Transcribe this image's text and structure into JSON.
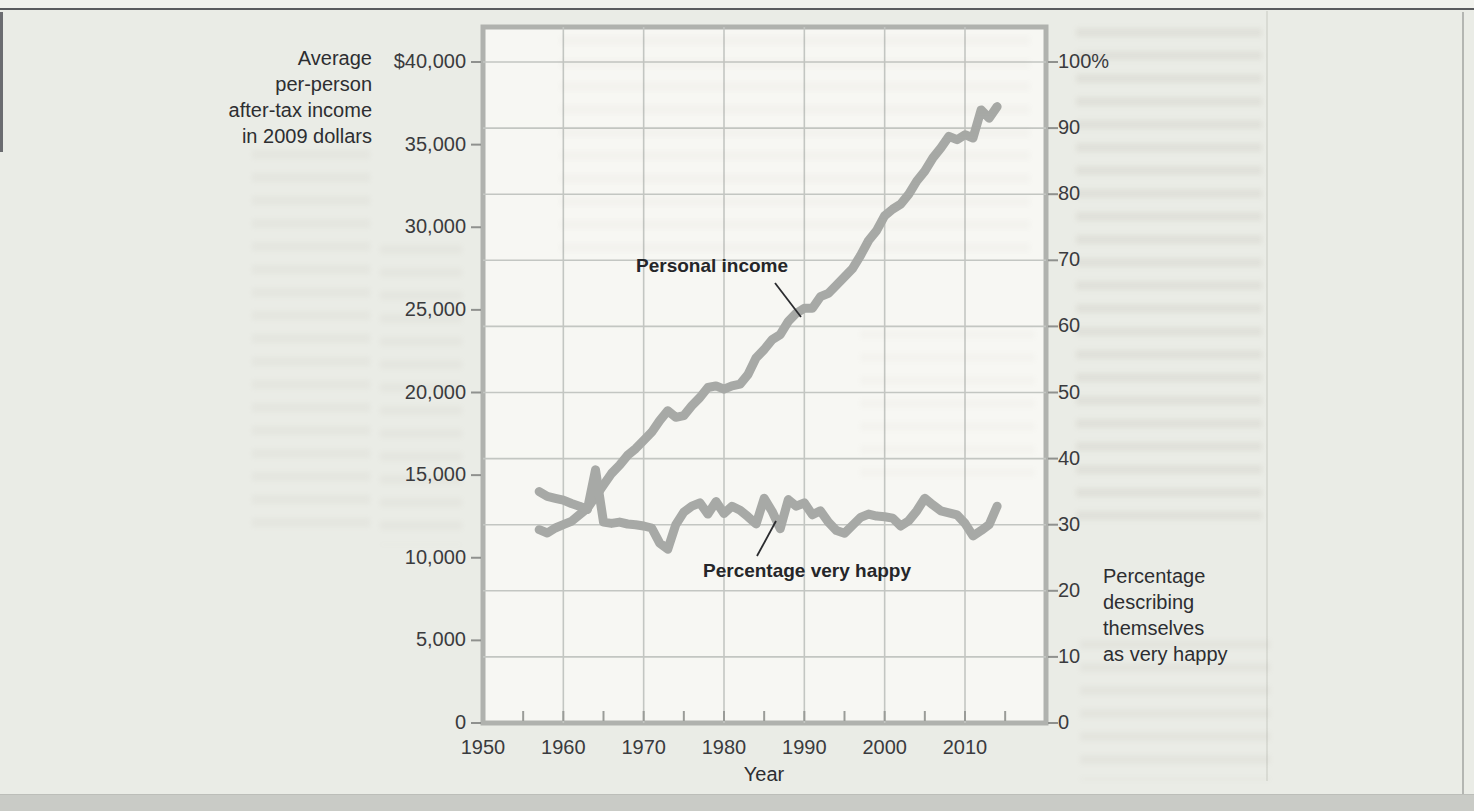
{
  "page": {
    "kind": "scanned textbook figure",
    "background_color": "#eaece6"
  },
  "chart_data": {
    "type": "line",
    "title": "",
    "x_axis": {
      "label": "Year",
      "tick_labels": [
        "1950",
        "1960",
        "1970",
        "1980",
        "1990",
        "2000",
        "2010"
      ],
      "tick_values": [
        1950,
        1960,
        1970,
        1980,
        1990,
        2000,
        2010
      ],
      "range": [
        1950,
        2020
      ],
      "minor_tick_step_years": 5,
      "gridline_step_years": 10
    },
    "y_left": {
      "title": "Average\nper-person\nafter-tax income\nin 2009 dollars",
      "tick_labels": [
        "$40,000",
        "35,000",
        "30,000",
        "25,000",
        "20,000",
        "15,000",
        "10,000",
        "5,000",
        "0"
      ],
      "tick_values": [
        40000,
        35000,
        30000,
        25000,
        20000,
        15000,
        10000,
        5000,
        0
      ],
      "range": [
        0,
        42200
      ]
    },
    "y_right": {
      "title": "Percentage\ndescribing\nthemselves\nas very happy",
      "tick_labels": [
        "100%",
        "90",
        "80",
        "70",
        "60",
        "50",
        "40",
        "30",
        "20",
        "10",
        "0"
      ],
      "tick_values": [
        100,
        90,
        80,
        70,
        60,
        50,
        40,
        30,
        20,
        10,
        0
      ],
      "range": [
        0,
        105.5
      ],
      "gridline_step_percent": 10
    },
    "grid": true,
    "legend": "in-plot annotations with pointer lines",
    "series": [
      {
        "name": "Personal income",
        "axis": "left",
        "points": [
          [
            1957,
            11700
          ],
          [
            1958,
            11500
          ],
          [
            1959,
            11800
          ],
          [
            1960,
            12000
          ],
          [
            1961,
            12200
          ],
          [
            1962,
            12600
          ],
          [
            1963,
            13000
          ],
          [
            1964,
            13700
          ],
          [
            1965,
            14400
          ],
          [
            1966,
            15100
          ],
          [
            1967,
            15600
          ],
          [
            1968,
            16200
          ],
          [
            1969,
            16600
          ],
          [
            1970,
            17100
          ],
          [
            1971,
            17600
          ],
          [
            1972,
            18300
          ],
          [
            1973,
            18900
          ],
          [
            1974,
            18500
          ],
          [
            1975,
            18600
          ],
          [
            1976,
            19200
          ],
          [
            1977,
            19700
          ],
          [
            1978,
            20300
          ],
          [
            1979,
            20400
          ],
          [
            1980,
            20200
          ],
          [
            1981,
            20400
          ],
          [
            1982,
            20500
          ],
          [
            1983,
            21100
          ],
          [
            1984,
            22100
          ],
          [
            1985,
            22600
          ],
          [
            1986,
            23200
          ],
          [
            1987,
            23500
          ],
          [
            1988,
            24300
          ],
          [
            1989,
            24800
          ],
          [
            1990,
            25100
          ],
          [
            1991,
            25100
          ],
          [
            1992,
            25800
          ],
          [
            1993,
            26000
          ],
          [
            1994,
            26500
          ],
          [
            1995,
            27000
          ],
          [
            1996,
            27500
          ],
          [
            1997,
            28300
          ],
          [
            1998,
            29200
          ],
          [
            1999,
            29800
          ],
          [
            2000,
            30700
          ],
          [
            2001,
            31100
          ],
          [
            2002,
            31400
          ],
          [
            2003,
            32000
          ],
          [
            2004,
            32800
          ],
          [
            2005,
            33400
          ],
          [
            2006,
            34200
          ],
          [
            2007,
            34800
          ],
          [
            2008,
            35500
          ],
          [
            2009,
            35300
          ],
          [
            2010,
            35600
          ],
          [
            2011,
            35400
          ],
          [
            2012,
            37100
          ],
          [
            2013,
            36600
          ],
          [
            2014,
            37300
          ]
        ]
      },
      {
        "name": "Percentage very happy",
        "axis": "right",
        "points": [
          [
            1957,
            35.0
          ],
          [
            1958,
            34.3
          ],
          [
            1959,
            34.0
          ],
          [
            1960,
            33.7
          ],
          [
            1961,
            33.2
          ],
          [
            1962,
            32.8
          ],
          [
            1963,
            32.3
          ],
          [
            1964,
            38.3
          ],
          [
            1965,
            30.4
          ],
          [
            1966,
            30.2
          ],
          [
            1967,
            30.4
          ],
          [
            1968,
            30.1
          ],
          [
            1969,
            30.0
          ],
          [
            1970,
            29.8
          ],
          [
            1971,
            29.5
          ],
          [
            1972,
            27.2
          ],
          [
            1973,
            26.3
          ],
          [
            1974,
            30.0
          ],
          [
            1975,
            31.9
          ],
          [
            1976,
            32.8
          ],
          [
            1977,
            33.3
          ],
          [
            1978,
            31.6
          ],
          [
            1979,
            33.5
          ],
          [
            1980,
            31.7
          ],
          [
            1981,
            32.8
          ],
          [
            1982,
            32.2
          ],
          [
            1983,
            31.2
          ],
          [
            1984,
            30.1
          ],
          [
            1985,
            34.0
          ],
          [
            1986,
            32.0
          ],
          [
            1987,
            29.4
          ],
          [
            1988,
            33.8
          ],
          [
            1989,
            32.8
          ],
          [
            1990,
            33.3
          ],
          [
            1991,
            31.5
          ],
          [
            1992,
            32.1
          ],
          [
            1993,
            30.4
          ],
          [
            1994,
            29.1
          ],
          [
            1995,
            28.7
          ],
          [
            1996,
            29.9
          ],
          [
            1997,
            31.1
          ],
          [
            1998,
            31.6
          ],
          [
            1999,
            31.3
          ],
          [
            2000,
            31.2
          ],
          [
            2001,
            31.0
          ],
          [
            2002,
            29.8
          ],
          [
            2003,
            30.6
          ],
          [
            2004,
            32.1
          ],
          [
            2005,
            34.0
          ],
          [
            2006,
            33.0
          ],
          [
            2007,
            32.1
          ],
          [
            2008,
            31.8
          ],
          [
            2009,
            31.5
          ],
          [
            2010,
            30.2
          ],
          [
            2011,
            28.3
          ],
          [
            2012,
            29.1
          ],
          [
            2013,
            30.0
          ],
          [
            2014,
            32.8
          ]
        ]
      }
    ],
    "annotations": [
      {
        "text": "Personal income",
        "points_to_series": "Personal income"
      },
      {
        "text": "Percentage very happy",
        "points_to_series": "Percentage very happy"
      }
    ],
    "colors": {
      "data_line": "#a7a9a6",
      "gridline": "#c3c6c2",
      "plot_border": "#b0b2ae",
      "plot_background": "#f7f7f3",
      "page_background": "#eaece6",
      "text": "#2d2e31"
    }
  }
}
